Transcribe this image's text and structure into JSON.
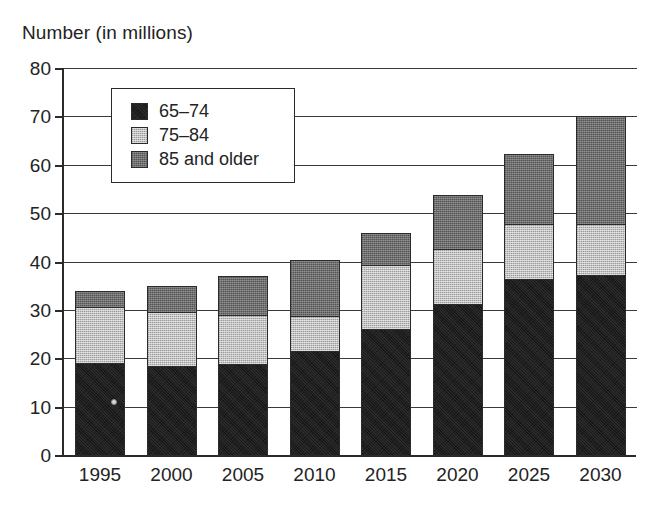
{
  "chart_data": {
    "type": "bar",
    "stacked": true,
    "title": "Number (in millions)",
    "xlabel": "",
    "ylabel": "Number (in millions)",
    "ylim": [
      0,
      80
    ],
    "ytick_step": 10,
    "yticks": [
      0,
      10,
      20,
      30,
      40,
      50,
      60,
      70,
      80
    ],
    "grid": true,
    "grid_axis": "y",
    "legend_position": "upper-left-inside",
    "categories": [
      "1995",
      "2000",
      "2005",
      "2010",
      "2015",
      "2020",
      "2025",
      "2030"
    ],
    "series": [
      {
        "name": "65–74",
        "color": "#1c1c1c",
        "values": [
          19.0,
          18.3,
          18.8,
          21.5,
          26.0,
          31.3,
          36.3,
          37.2
        ]
      },
      {
        "name": "75–84",
        "color": "#c2c2c2",
        "values": [
          11.5,
          11.2,
          10.2,
          7.3,
          13.3,
          11.2,
          11.5,
          10.5
        ]
      },
      {
        "name": "85 and older",
        "color": "#6f6f6f",
        "values": [
          3.5,
          5.5,
          8.0,
          11.5,
          6.7,
          11.2,
          14.5,
          22.3
        ]
      }
    ],
    "totals": [
      34.0,
      35.0,
      37.0,
      40.3,
      46.0,
      53.7,
      62.3,
      70.0
    ]
  },
  "legend": {
    "items": [
      {
        "label": "65–74",
        "swatch": "swatch-65-74"
      },
      {
        "label": "75–84",
        "swatch": "swatch-75-84"
      },
      {
        "label": "85 and older",
        "swatch": "swatch-85-older"
      }
    ]
  },
  "caption": {
    "text": ""
  }
}
